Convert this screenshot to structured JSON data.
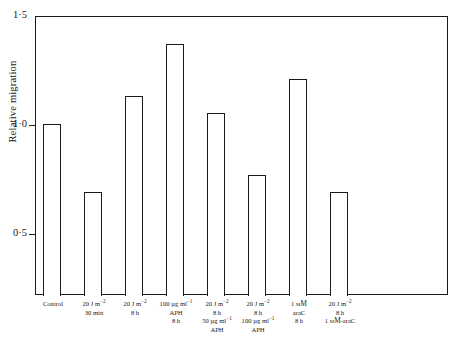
{
  "chart_data": {
    "type": "bar",
    "title": "",
    "xlabel": "",
    "ylabel": "Relative migration",
    "ylim": [
      0.22,
      1.5
    ],
    "yticks": [
      {
        "value": 1.5,
        "label": "1·5"
      },
      {
        "value": 1.0,
        "label": "1·0"
      },
      {
        "value": 0.5,
        "label": "0·5"
      }
    ],
    "grid": false,
    "legend": "none",
    "categories": [
      "Control",
      "20 J m⁻² / 30 min",
      "20 J m⁻² / 8 h",
      "100 µg ml⁻¹ APH / 8 h",
      "20 J m⁻² / 8 h / 50 µg ml⁻¹ APH",
      "20 J m⁻² / 8 h / 100 µg ml⁻¹ APH",
      "1 mM araC / 8 h",
      "20 J m⁻² / 8 h / 1 mM-araC"
    ],
    "values": [
      1.0,
      0.69,
      1.13,
      1.37,
      1.05,
      0.77,
      1.21,
      0.69
    ]
  },
  "axis": {
    "y_title": "Relative migration"
  },
  "x_labels": [
    {
      "lines": [
        {
          "text": "Control",
          "smallcaps": false,
          "sup": ""
        }
      ]
    },
    {
      "lines": [
        {
          "text": "20 J m",
          "smallcaps": false,
          "sup": "−2"
        },
        {
          "text": "30 min",
          "smallcaps": false,
          "sup": ""
        }
      ]
    },
    {
      "lines": [
        {
          "text": "20 J m",
          "smallcaps": false,
          "sup": "−2"
        },
        {
          "text": "8 h",
          "smallcaps": false,
          "sup": ""
        }
      ]
    },
    {
      "lines": [
        {
          "text": "100 µg ml",
          "smallcaps": false,
          "sup": "−1"
        },
        {
          "text": "APH",
          "smallcaps": false,
          "sup": ""
        },
        {
          "text": "8 h",
          "smallcaps": false,
          "sup": ""
        }
      ]
    },
    {
      "lines": [
        {
          "text": "20 J m",
          "smallcaps": false,
          "sup": "−2"
        },
        {
          "text": "8 h",
          "smallcaps": false,
          "sup": ""
        },
        {
          "text": "50 µg ml",
          "smallcaps": false,
          "sup": "−1"
        },
        {
          "text": "APH",
          "smallcaps": false,
          "sup": ""
        }
      ]
    },
    {
      "lines": [
        {
          "text": "20 J m",
          "smallcaps": false,
          "sup": "−2"
        },
        {
          "text": "8 h",
          "smallcaps": false,
          "sup": ""
        },
        {
          "text": "100 µg ml",
          "smallcaps": false,
          "sup": "−1"
        },
        {
          "text": "APH",
          "smallcaps": false,
          "sup": ""
        }
      ]
    },
    {
      "lines": [
        {
          "text": "1 ",
          "smallcaps": false,
          "sup": "",
          "sc": "mM"
        },
        {
          "text": "araC",
          "smallcaps": false,
          "sup": ""
        },
        {
          "text": "8 h",
          "smallcaps": false,
          "sup": ""
        }
      ]
    },
    {
      "lines": [
        {
          "text": "20 J m",
          "smallcaps": false,
          "sup": "−2"
        },
        {
          "text": "8 h",
          "smallcaps": false,
          "sup": ""
        },
        {
          "text": "1 ",
          "smallcaps": false,
          "sup": "",
          "sc": "mM",
          "tail": "-araC"
        }
      ]
    }
  ],
  "colors": {
    "ink": "#1a1a1a",
    "background": "#ffffff",
    "bar_fill": "#ffffff"
  }
}
